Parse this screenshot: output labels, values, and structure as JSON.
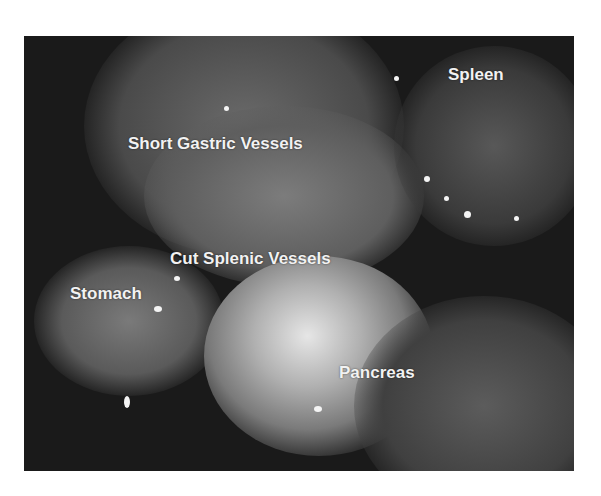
{
  "image": {
    "kind": "grayscale laparoscopic surgical photograph",
    "labels": [
      {
        "id": "spleen",
        "text": "Spleen"
      },
      {
        "id": "short-gastric-vessels",
        "text": "Short Gastric Vessels"
      },
      {
        "id": "cut-splenic-vessels",
        "text": "Cut Splenic Vessels"
      },
      {
        "id": "stomach",
        "text": "Stomach"
      },
      {
        "id": "pancreas",
        "text": "Pancreas"
      }
    ]
  }
}
